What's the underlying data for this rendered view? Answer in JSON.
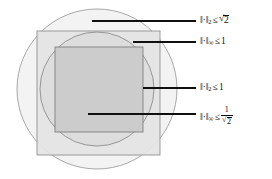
{
  "figure": {
    "background_color": "#ffffff",
    "shapes": {
      "outer_circle": {
        "name": "l2 ball of radius sqrt(2)",
        "center_x": 97,
        "center_y": 89,
        "radius": 80,
        "fill": "#f2f2f2",
        "stroke": "#9a9a9a"
      },
      "outer_square": {
        "name": "l-infinity ball of radius 1",
        "x": 37,
        "y": 31,
        "width": 123,
        "height": 124,
        "fill": "#e3e3e3",
        "stroke": "#8f8f8f"
      },
      "inner_circle": {
        "name": "l2 ball of radius 1",
        "center_x": 97,
        "center_y": 89,
        "radius": 57,
        "fill": "#dadada",
        "stroke": "#8f8f8f"
      },
      "inner_square": {
        "name": "l-infinity ball of radius 1/sqrt(2)",
        "x": 55,
        "y": 47,
        "width": 88,
        "height": 85,
        "fill": "#c9c9c9",
        "stroke": "#7d7d7d"
      }
    },
    "leader_lines": [
      {
        "name": "leader-l2-sqrt2",
        "x1": 92,
        "y1": 21,
        "x2": 196,
        "y2": 21
      },
      {
        "name": "leader-linf-1",
        "x1": 133,
        "y1": 42,
        "x2": 196,
        "y2": 42
      },
      {
        "name": "leader-l2-1",
        "x1": 143,
        "y1": 88,
        "x2": 196,
        "y2": 88
      },
      {
        "name": "leader-linf-inv-sqrt2",
        "x1": 88,
        "y1": 114,
        "x2": 196,
        "y2": 114
      }
    ],
    "line_color": "#101010"
  },
  "labels": {
    "l2_sqrt2": {
      "norm": "‖·‖",
      "subscript": "2",
      "relation": "≤",
      "value": "√2",
      "radicand": "2",
      "plain": "‖·‖₂ ≤ √2"
    },
    "linf_1": {
      "norm": "‖·‖",
      "subscript": "∞",
      "relation": "≤",
      "value": "1",
      "plain": "‖·‖∞ ≤ 1"
    },
    "l2_1": {
      "norm": "‖·‖",
      "subscript": "2",
      "relation": "≤",
      "value": "1",
      "plain": "‖·‖₂ ≤ 1"
    },
    "linf_inv_sqrt2": {
      "norm": "‖·‖",
      "subscript": "∞",
      "relation": "≤",
      "numerator": "1",
      "denominator_radicand": "2",
      "plain": "‖·‖∞ ≤ 1/√2"
    }
  }
}
